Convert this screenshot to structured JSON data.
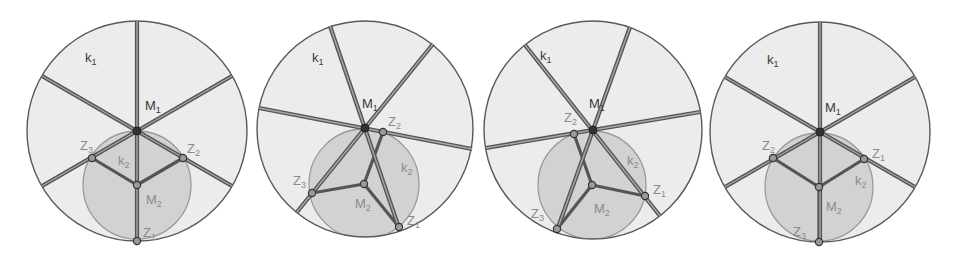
{
  "colors": {
    "background": "#ffffff",
    "k1_fill": "#ececec",
    "k1_stroke": "#5a5a5a",
    "k2_fill": "#d2d2d2",
    "k2_stroke": "#9a9a9a",
    "line_outer": "#555555",
    "line_inner": "#a8a8a8",
    "center_point": "#333333",
    "point_fill": "#9a9a9a",
    "point_stroke": "#333333"
  },
  "figures": [
    {
      "id": "figure-1",
      "k1": {
        "cx": 137,
        "cy": 131,
        "r": 110,
        "label": "k",
        "sub": "1",
        "lx": 85,
        "ly": 62
      },
      "k2": {
        "cx": 137,
        "cy": 185,
        "r": 54,
        "label": "k",
        "sub": "2",
        "lx": 118,
        "ly": 165
      },
      "M1": {
        "x": 137,
        "y": 131,
        "label": "M",
        "sub": "1",
        "lx": 145,
        "ly": 110
      },
      "M2": {
        "x": 137,
        "y": 185,
        "label": "M",
        "sub": "2",
        "lx": 146,
        "ly": 204
      },
      "Z": [
        {
          "x": 137,
          "y": 241,
          "label": "Z",
          "sub": "1",
          "lx": 143,
          "ly": 237
        },
        {
          "x": 183,
          "y": 158,
          "label": "Z",
          "sub": "2",
          "lx": 187,
          "ly": 153
        },
        {
          "x": 92,
          "y": 158,
          "label": "Z",
          "sub": "3",
          "lx": 80,
          "ly": 150
        }
      ],
      "lines": [
        {
          "x1": 137,
          "y1": 21,
          "x2": 137,
          "y2": 241
        },
        {
          "x1": 42,
          "y1": 76,
          "x2": 232,
          "y2": 186
        },
        {
          "x1": 42,
          "y1": 186,
          "x2": 232,
          "y2": 76
        }
      ]
    },
    {
      "id": "figure-2",
      "k1": {
        "cx": 365,
        "cy": 129,
        "r": 108,
        "label": "k",
        "sub": "1",
        "lx": 312,
        "ly": 62
      },
      "k2": {
        "cx": 364,
        "cy": 184,
        "r": 55,
        "label": "k",
        "sub": "2",
        "lx": 401,
        "ly": 172
      },
      "M1": {
        "x": 365,
        "y": 128,
        "label": "M",
        "sub": "1",
        "lx": 362,
        "ly": 108
      },
      "M2": {
        "x": 364,
        "y": 184,
        "label": "M",
        "sub": "2",
        "lx": 355,
        "ly": 208
      },
      "Z": [
        {
          "x": 399,
          "y": 227,
          "label": "Z",
          "sub": "1",
          "lx": 407,
          "ly": 225
        },
        {
          "x": 383,
          "y": 132,
          "label": "Z",
          "sub": "2",
          "lx": 388,
          "ly": 126
        },
        {
          "x": 312,
          "y": 193,
          "label": "Z",
          "sub": "3",
          "lx": 293,
          "ly": 185
        }
      ],
      "lines": [
        {
          "x1": 330,
          "y1": 26,
          "x2": 400,
          "y2": 231
        },
        {
          "x1": 297,
          "y1": 212,
          "x2": 433,
          "y2": 44
        },
        {
          "x1": 259,
          "y1": 108,
          "x2": 472,
          "y2": 149
        }
      ]
    },
    {
      "id": "figure-3",
      "k1": {
        "cx": 593,
        "cy": 130,
        "r": 109,
        "label": "k",
        "sub": "1",
        "lx": 540,
        "ly": 60
      },
      "k2": {
        "cx": 592,
        "cy": 185,
        "r": 54,
        "label": "k",
        "sub": "2",
        "lx": 627,
        "ly": 165
      },
      "M1": {
        "x": 593,
        "y": 130,
        "label": "M",
        "sub": "1",
        "lx": 589,
        "ly": 108
      },
      "M2": {
        "x": 592,
        "y": 185,
        "label": "M",
        "sub": "2",
        "lx": 594,
        "ly": 213
      },
      "Z": [
        {
          "x": 645,
          "y": 196,
          "label": "Z",
          "sub": "1",
          "lx": 653,
          "ly": 194
        },
        {
          "x": 574,
          "y": 134,
          "label": "Z",
          "sub": "2",
          "lx": 564,
          "ly": 122
        },
        {
          "x": 557,
          "y": 229,
          "label": "Z",
          "sub": "3",
          "lx": 531,
          "ly": 218
        }
      ],
      "lines": [
        {
          "x1": 525,
          "y1": 45,
          "x2": 660,
          "y2": 216
        },
        {
          "x1": 556,
          "y1": 233,
          "x2": 630,
          "y2": 27
        },
        {
          "x1": 486,
          "y1": 148,
          "x2": 700,
          "y2": 112
        }
      ]
    },
    {
      "id": "figure-4",
      "k1": {
        "cx": 820,
        "cy": 132,
        "r": 110,
        "label": "k",
        "sub": "1",
        "lx": 767,
        "ly": 64
      },
      "k2": {
        "cx": 819,
        "cy": 187,
        "r": 54,
        "label": "k",
        "sub": "2",
        "lx": 855,
        "ly": 185
      },
      "M1": {
        "x": 820,
        "y": 132,
        "label": "M",
        "sub": "1",
        "lx": 825,
        "ly": 112
      },
      "M2": {
        "x": 819,
        "y": 187,
        "label": "M",
        "sub": "2",
        "lx": 826,
        "ly": 211
      },
      "Z": [
        {
          "x": 864,
          "y": 159,
          "label": "Z",
          "sub": "1",
          "lx": 872,
          "ly": 158
        },
        {
          "x": 773,
          "y": 158,
          "label": "Z",
          "sub": "2",
          "lx": 762,
          "ly": 150
        },
        {
          "x": 819,
          "y": 242,
          "label": "Z",
          "sub": "3",
          "lx": 793,
          "ly": 236
        }
      ],
      "lines": [
        {
          "x1": 820,
          "y1": 22,
          "x2": 820,
          "y2": 242
        },
        {
          "x1": 725,
          "y1": 77,
          "x2": 915,
          "y2": 187
        },
        {
          "x1": 725,
          "y1": 187,
          "x2": 915,
          "y2": 77
        }
      ]
    }
  ]
}
